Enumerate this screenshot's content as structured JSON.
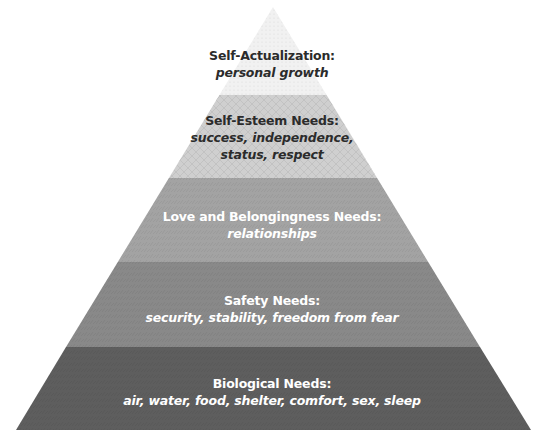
{
  "diagram": {
    "type": "pyramid",
    "layers": [
      {
        "title": "Self-Actualization:",
        "description": [
          "personal growth"
        ],
        "fill": "#f1f1f1",
        "text_color": "#2b2b2b"
      },
      {
        "title": "Self-Esteem Needs:",
        "description": [
          "success, independence,",
          "status, respect"
        ],
        "fill": "#cfcfcf",
        "text_color": "#2b2b2b"
      },
      {
        "title": "Love and Belongingness Needs:",
        "description": [
          "relationships"
        ],
        "fill": "#a3a3a3",
        "text_color": "#ffffff"
      },
      {
        "title": "Safety Needs:",
        "description": [
          "security, stability, freedom from fear"
        ],
        "fill": "#898989",
        "text_color": "#ffffff"
      },
      {
        "title": "Biological Needs:",
        "description": [
          "air, water, food, shelter, comfort, sex, sleep"
        ],
        "fill": "#5e5e5e",
        "text_color": "#ffffff"
      }
    ]
  }
}
